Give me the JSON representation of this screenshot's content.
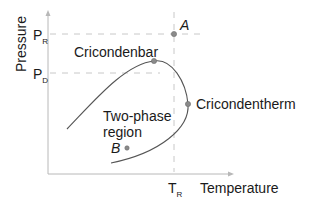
{
  "diagram": {
    "axes": {
      "y_label": "Pressure",
      "x_label": "Temperature",
      "y_ticks": [
        {
          "main": "P",
          "sub": "R"
        },
        {
          "main": "P",
          "sub": "D"
        }
      ],
      "x_ticks": [
        {
          "main": "T",
          "sub": "R"
        }
      ]
    },
    "labels": {
      "cricondenbar": "Cricondenbar",
      "cricondentherm": "Cricondentherm",
      "region_line1": "Two-phase",
      "region_line2": "region",
      "point_a": "A",
      "point_b": "B"
    },
    "colors": {
      "axis": "#b8b8b8",
      "dashed_guides": "#c8c8c8",
      "curve": "#555555",
      "points": "#8a8a8a",
      "text": "#1a1a1a"
    }
  }
}
